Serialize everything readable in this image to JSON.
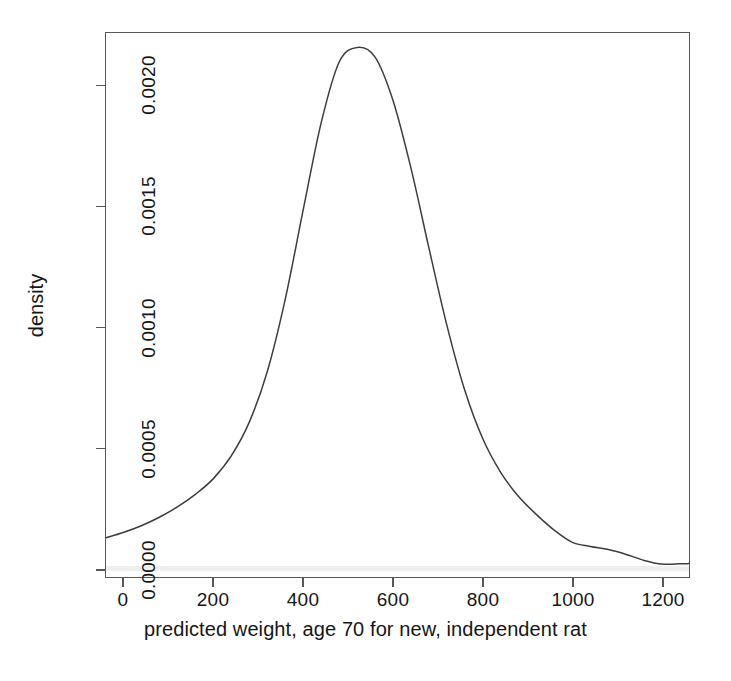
{
  "figure": {
    "background_color": "#ffffff",
    "line_color": "#3d3d3d",
    "axis_color": "#585858"
  },
  "axes": {
    "x_title": "predicted weight, age 70 for new, independent rat",
    "y_title": "density",
    "x_ticks": [
      "0",
      "200",
      "400",
      "600",
      "800",
      "1000",
      "1200"
    ],
    "y_ticks": [
      "0.0000",
      "0.0005",
      "0.0010",
      "0.0015",
      "0.0020"
    ]
  },
  "chart_data": {
    "type": "line",
    "title": "",
    "subtitle": "",
    "xlabel": "predicted weight, age 70 for new, independent rat",
    "ylabel": "density",
    "xlim": [
      -40,
      1260
    ],
    "ylim": [
      -3.35e-05,
      0.00222
    ],
    "xticks": [
      0,
      200,
      400,
      600,
      800,
      1000,
      1200
    ],
    "yticks": [
      0.0,
      0.0005,
      0.001,
      0.0015,
      0.002
    ],
    "grid": false,
    "legend": null,
    "annotations": [],
    "series": [
      {
        "name": "density",
        "x": [
          -40,
          0,
          40,
          80,
          120,
          160,
          200,
          240,
          280,
          320,
          360,
          400,
          440,
          480,
          520,
          560,
          600,
          640,
          680,
          720,
          760,
          800,
          840,
          880,
          920,
          960,
          1000,
          1040,
          1080,
          1120,
          1160,
          1200,
          1240,
          1260
        ],
        "y": [
          0.000129,
          0.000152,
          0.00018,
          0.000215,
          0.000258,
          0.00031,
          0.000375,
          0.00047,
          0.00061,
          0.00082,
          0.00112,
          0.00149,
          0.00185,
          0.0021,
          0.00216,
          0.00212,
          0.00194,
          0.00166,
          0.00133,
          0.00101,
          0.00074,
          0.00054,
          0.0004,
          0.0003,
          0.000225,
          0.00016,
          0.00011,
          9.3e-05,
          8e-05,
          6e-05,
          3.5e-05,
          2e-05,
          2.1e-05,
          2.2e-05
        ]
      }
    ],
    "peak": {
      "x": 523,
      "y": 0.00216
    }
  }
}
